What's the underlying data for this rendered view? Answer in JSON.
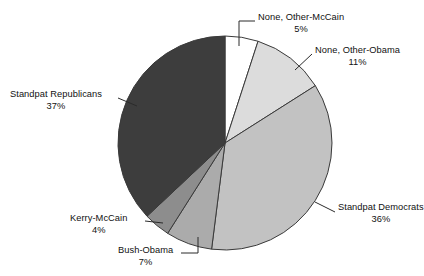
{
  "chart_data": {
    "type": "pie",
    "title": "",
    "subtitle": "",
    "legend_position": "callout-labels",
    "grid": false,
    "start_angle_deg": 0,
    "direction": "clockwise",
    "categories": [
      "None, Other-McCain",
      "None, Other-Obama",
      "Standpat Democrats",
      "Bush-Obama",
      "Kerry-McCain",
      "Standpat Republicans"
    ],
    "values": [
      5,
      11,
      36,
      7,
      4,
      37
    ],
    "value_labels": [
      "5%",
      "11%",
      "36%",
      "7%",
      "4%",
      "37%"
    ],
    "colors": [
      "#ffffff",
      "#dcdcdc",
      "#c2c2c2",
      "#ababab",
      "#8d8d8d",
      "#3d3d3d"
    ],
    "slice_border_color": "#3a3a3a",
    "units": "percent",
    "total": 100
  },
  "labels": {
    "none_mccain": {
      "name": "None, Other-McCain",
      "pct": "5%"
    },
    "none_obama": {
      "name": "None, Other-Obama",
      "pct": "11%"
    },
    "sp_dem": {
      "name": "Standpat Democrats",
      "pct": "36%"
    },
    "bush_obama": {
      "name": "Bush-Obama",
      "pct": "7%"
    },
    "kerry_mccain": {
      "name": "Kerry-McCain",
      "pct": "4%"
    },
    "sp_rep": {
      "name": "Standpat Republicans",
      "pct": "37%"
    }
  }
}
